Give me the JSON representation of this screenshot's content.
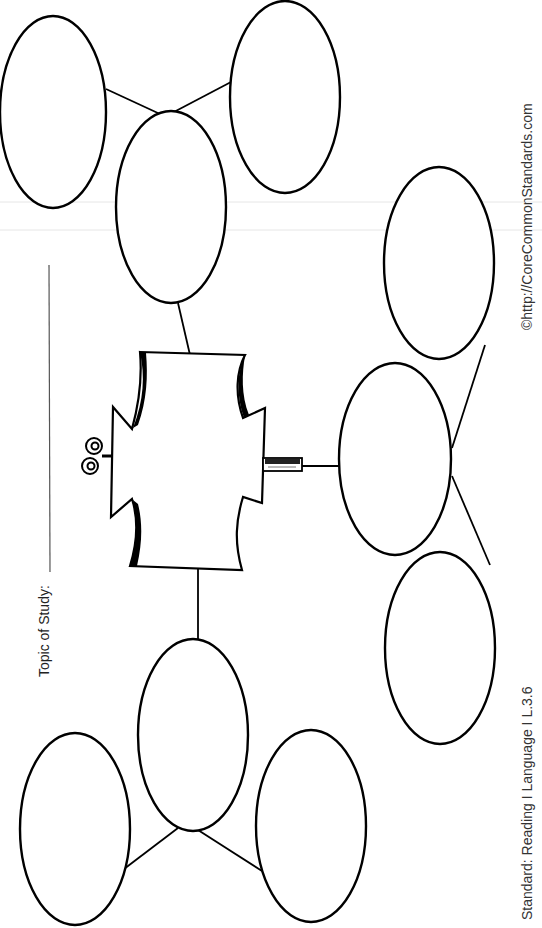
{
  "worksheet": {
    "topic_label": "Topic of Study:",
    "topic_value": "",
    "copyright": "©http://CoreCommonStandards.com",
    "standard": "Standard: Reading I Language I L.3.6"
  },
  "diagram": {
    "type": "concept map (rotated worksheet)",
    "center": {
      "shape": "decorative-plaque",
      "text": ""
    },
    "nodes": [
      {
        "id": "branch-top",
        "role": "branch",
        "text": ""
      },
      {
        "id": "leaf-top-left",
        "role": "leaf",
        "parent": "branch-top",
        "text": ""
      },
      {
        "id": "leaf-top-right",
        "role": "leaf",
        "parent": "branch-top",
        "text": ""
      },
      {
        "id": "branch-right",
        "role": "branch",
        "text": ""
      },
      {
        "id": "leaf-right-upper",
        "role": "leaf",
        "parent": "branch-right",
        "text": ""
      },
      {
        "id": "leaf-right-lower",
        "role": "leaf",
        "parent": "branch-right",
        "text": ""
      },
      {
        "id": "branch-bottom",
        "role": "branch",
        "text": ""
      },
      {
        "id": "leaf-bottom-left",
        "role": "leaf",
        "parent": "branch-bottom",
        "text": ""
      },
      {
        "id": "leaf-bottom-right",
        "role": "leaf",
        "parent": "branch-bottom",
        "text": ""
      }
    ],
    "colors": {
      "stroke": "#000000",
      "background": "#ffffff"
    }
  }
}
